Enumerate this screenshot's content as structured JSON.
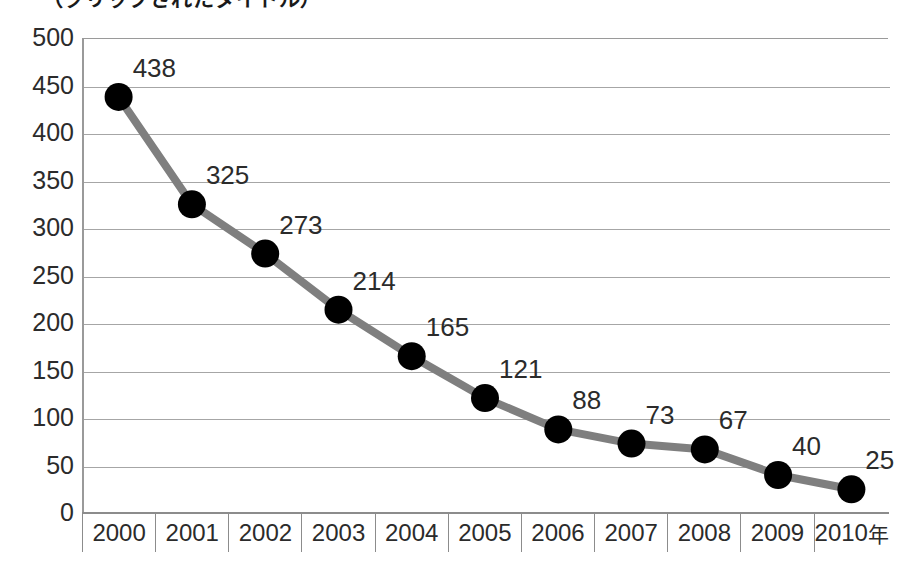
{
  "title": {
    "text": "（クリップされたタイトル）",
    "visible": "partially-cropped"
  },
  "colors": {
    "line": "#7f7f7f",
    "marker": "#000000",
    "gridline": "#a6a6a6",
    "axis": "#8c8c8c",
    "text": "#2b2b2b",
    "background": "#ffffff"
  },
  "chart_data": {
    "type": "line",
    "title": "",
    "xlabel": "年",
    "ylabel": "",
    "categories": [
      "2000",
      "2001",
      "2002",
      "2003",
      "2004",
      "2005",
      "2006",
      "2007",
      "2008",
      "2009",
      "2010年"
    ],
    "x": [
      2000,
      2001,
      2002,
      2003,
      2004,
      2005,
      2006,
      2007,
      2008,
      2009,
      2010
    ],
    "values": [
      438,
      325,
      273,
      214,
      165,
      121,
      88,
      73,
      67,
      40,
      25
    ],
    "data_labels": [
      "438",
      "325",
      "273",
      "214",
      "165",
      "121",
      "88",
      "73",
      "67",
      "40",
      "25"
    ],
    "ylim": [
      0,
      500
    ],
    "yticks": [
      0,
      50,
      100,
      150,
      200,
      250,
      300,
      350,
      400,
      450,
      500
    ],
    "ytick_labels": [
      "0",
      "50",
      "100",
      "150",
      "200",
      "250",
      "300",
      "350",
      "400",
      "450",
      "500"
    ],
    "grid": "horizontal",
    "legend": "none",
    "marker": "filled-circle",
    "series": [
      {
        "name": "",
        "values": [
          438,
          325,
          273,
          214,
          165,
          121,
          88,
          73,
          67,
          40,
          25
        ]
      }
    ]
  }
}
